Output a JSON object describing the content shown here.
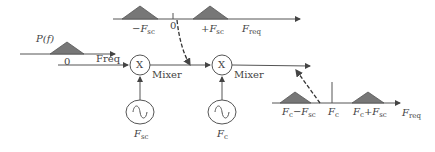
{
  "diagram": {
    "input_spectrum": {
      "title": "P(f)",
      "zero_label": "0",
      "axis_label": "Freq"
    },
    "subcarrier_spectrum": {
      "neg_label": "−F",
      "neg_sub": "sc",
      "zero_label": "0",
      "pos_label": "+F",
      "pos_sub": "sc",
      "axis_label": "F",
      "axis_sub": "req"
    },
    "mixer1": {
      "symbol": "X",
      "label": "Mixer",
      "oscillator_label": "F",
      "oscillator_sub": "sc"
    },
    "mixer2": {
      "symbol": "X",
      "label": "Mixer",
      "oscillator_label": "F",
      "oscillator_sub": "c"
    },
    "output_spectrum": {
      "lower_label": "F",
      "lower_sub1": "c",
      "lower_mid": "−F",
      "lower_sub2": "sc",
      "center_label": "F",
      "center_sub": "c",
      "upper_label": "F",
      "upper_sub1": "c",
      "upper_mid": "+F",
      "upper_sub2": "sc",
      "axis_label": "F",
      "axis_sub": "req"
    },
    "colors": {
      "line": "#555555",
      "fill": "#777777"
    }
  }
}
